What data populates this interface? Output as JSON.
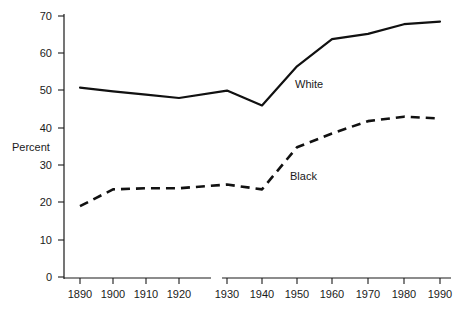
{
  "chart_data": {
    "type": "line",
    "title": "",
    "xlabel": "",
    "ylabel": "Percent",
    "ylim": [
      0,
      70
    ],
    "ytick_values": [
      0,
      10,
      20,
      30,
      40,
      50,
      60,
      70
    ],
    "ytick_labels": [
      "0",
      "10",
      "20",
      "30",
      "40",
      "50",
      "60",
      "70"
    ],
    "grid": false,
    "legend_position": "inline-annotation",
    "axis_break": {
      "present": true,
      "between": [
        "1920",
        "1930"
      ],
      "note": "horizontal axis line is broken between the 1920 and 1930 ticks"
    },
    "x": [
      1890,
      1900,
      1910,
      1920,
      1930,
      1940,
      1950,
      1960,
      1970,
      1980,
      1990
    ],
    "xtick_labels": [
      "1890",
      "1900",
      "1910",
      "1920",
      "1930",
      "1940",
      "1950",
      "1960",
      "1970",
      "1980",
      "1990"
    ],
    "series": [
      {
        "name": "White",
        "label": "White",
        "linestyle": "solid",
        "color": "#111111",
        "values": [
          50.8,
          49.8,
          48.9,
          48.0,
          50.0,
          46.0,
          56.5,
          63.8,
          65.2,
          67.8,
          68.5
        ]
      },
      {
        "name": "Black",
        "label": "Black",
        "linestyle": "dashed",
        "color": "#111111",
        "values": [
          19.0,
          23.5,
          23.8,
          23.8,
          24.8,
          23.5,
          34.8,
          38.5,
          41.8,
          43.0,
          42.5
        ]
      }
    ],
    "annotations": [
      {
        "text": "White",
        "x_px": 295,
        "y_px": 78
      },
      {
        "text": "Black",
        "x_px": 290,
        "y_px": 170
      }
    ]
  },
  "axes": {
    "y_axis_label": "Percent",
    "y_ticks": [
      {
        "label": "70",
        "y_px": 16
      },
      {
        "label": "60",
        "y_px": 53
      },
      {
        "label": "50",
        "y_px": 90
      },
      {
        "label": "40",
        "y_px": 128
      },
      {
        "label": "30",
        "y_px": 165
      },
      {
        "label": "20",
        "y_px": 202
      },
      {
        "label": "10",
        "y_px": 240
      },
      {
        "label": "0",
        "y_px": 277
      }
    ],
    "x_ticks": [
      {
        "label": "1890",
        "x_px": 80
      },
      {
        "label": "1900",
        "x_px": 113
      },
      {
        "label": "1910",
        "x_px": 146
      },
      {
        "label": "1920",
        "x_px": 179
      },
      {
        "label": "1930",
        "x_px": 227
      },
      {
        "label": "1940",
        "x_px": 262
      },
      {
        "label": "1950",
        "x_px": 297
      },
      {
        "label": "1960",
        "x_px": 332
      },
      {
        "label": "1970",
        "x_px": 368
      },
      {
        "label": "1980",
        "x_px": 404
      },
      {
        "label": "1990",
        "x_px": 440
      }
    ]
  },
  "colors": {
    "line": "#111111",
    "axis": "#1a1a1a",
    "text": "#1a1a1a",
    "background": "#ffffff"
  }
}
